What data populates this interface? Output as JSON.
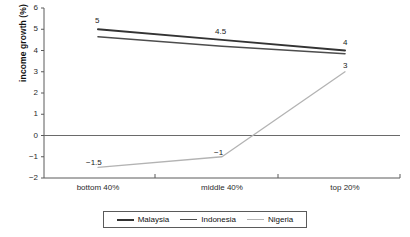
{
  "chart_data": {
    "type": "line",
    "title": "",
    "xlabel": "",
    "ylabel": "income growth (%)",
    "categories": [
      "bottom 40%",
      "middle 40%",
      "top 20%"
    ],
    "ylim": [
      -2,
      6
    ],
    "yticks": [
      -2,
      -1,
      0,
      1,
      2,
      3,
      4,
      5,
      6
    ],
    "ytick_labels": [
      "−2",
      "−1",
      "0",
      "1",
      "2",
      "3",
      "4",
      "5",
      "6"
    ],
    "grid": false,
    "zero_line": true,
    "legend_position": "bottom",
    "series": [
      {
        "name": "Malaysia",
        "color": "#333333",
        "width": 2.0,
        "values": [
          5,
          4.5,
          4
        ],
        "labels": [
          "5",
          "4.5",
          "4"
        ],
        "label_offsets": [
          {
            "dx": -3,
            "dy": -13
          },
          {
            "dx": -7,
            "dy": -13
          },
          {
            "dx": -2,
            "dy": -13
          }
        ]
      },
      {
        "name": "Indonesia",
        "color": "#4d4d4d",
        "width": 1.6,
        "values": [
          4.65,
          4.2,
          3.85
        ],
        "labels": [
          "",
          "",
          ""
        ],
        "label_offsets": [
          {
            "dx": 0,
            "dy": 0
          },
          {
            "dx": 0,
            "dy": 0
          },
          {
            "dx": 0,
            "dy": 0
          }
        ]
      },
      {
        "name": "Nigeria",
        "color": "#b3b3b3",
        "width": 1.3,
        "values": [
          -1.5,
          -1,
          3
        ],
        "labels": [
          "−1.5",
          "−1",
          "3"
        ],
        "label_offsets": [
          {
            "dx": -12,
            "dy": -9
          },
          {
            "dx": -8,
            "dy": -9
          },
          {
            "dx": -2,
            "dy": -11
          }
        ]
      }
    ]
  },
  "axis": {
    "y_title": "income growth (%)",
    "y_tick_labels": [
      "6",
      "5",
      "4",
      "3",
      "2",
      "1",
      "0",
      "−1",
      "−2"
    ],
    "x_tick_labels": [
      "bottom 40%",
      "middle 40%",
      "top 20%"
    ]
  },
  "legend": {
    "items": [
      {
        "label": "Malaysia",
        "color": "#333333",
        "width": "2px"
      },
      {
        "label": "Indonesia",
        "color": "#4d4d4d",
        "width": "1.6px"
      },
      {
        "label": "Nigeria",
        "color": "#b3b3b3",
        "width": "1.3px"
      }
    ]
  }
}
